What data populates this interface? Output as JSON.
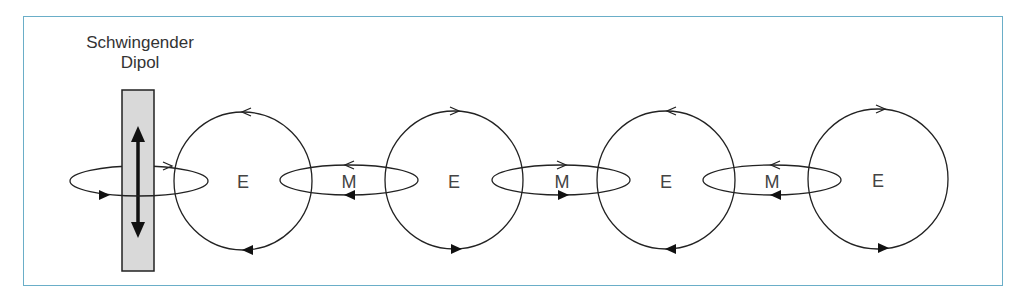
{
  "title": {
    "line1": "Schwingender",
    "line2": "Dipol"
  },
  "colors": {
    "frame": "#6aaec8",
    "stroke": "#222222",
    "dipole_fill": "#d9d9d9"
  },
  "labels": {
    "e1": "E",
    "m1": "M",
    "e2": "E",
    "m2": "M",
    "e3": "E",
    "m3": "M",
    "e4": "E"
  },
  "fields": [
    {
      "type": "E",
      "kind": "circle",
      "cx": 243,
      "cy": 181,
      "r": 69,
      "direction": "counterclockwise-top-left"
    },
    {
      "type": "M",
      "kind": "ellipse",
      "cx": 349,
      "cy": 180,
      "direction": "left"
    },
    {
      "type": "E",
      "kind": "circle",
      "cx": 454,
      "cy": 180,
      "r": 69,
      "direction": "right"
    },
    {
      "type": "M",
      "kind": "ellipse",
      "cx": 561,
      "cy": 180,
      "direction": "right"
    },
    {
      "type": "E",
      "kind": "circle",
      "cx": 666,
      "cy": 180,
      "r": 69,
      "direction": "left"
    },
    {
      "type": "M",
      "kind": "ellipse",
      "cx": 772,
      "cy": 180,
      "direction": "left"
    },
    {
      "type": "E",
      "kind": "circle",
      "cx": 878,
      "cy": 179,
      "r": 69,
      "direction": "right"
    }
  ]
}
